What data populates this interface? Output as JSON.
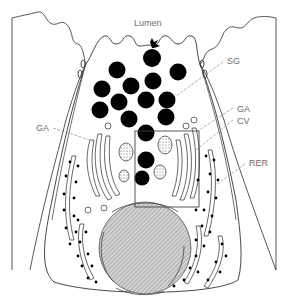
{
  "labels": {
    "lumen": "Lumen",
    "sg": "SG",
    "ga_right": "GA",
    "cv": "CV",
    "rer": "RER",
    "ga_left": "GA"
  },
  "colors": {
    "outline": "#333333",
    "granule": "#000000",
    "label": "#6e6e6e",
    "leader": "#8a8a8a",
    "nucleus_fill": "#b8b8b8"
  }
}
